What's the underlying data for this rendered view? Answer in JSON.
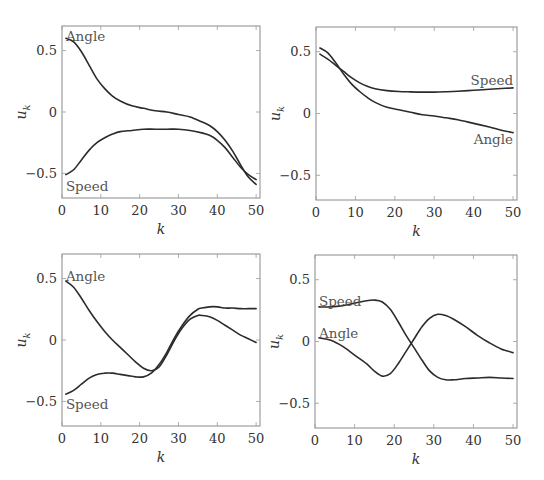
{
  "figure": {
    "panels_layout": "2x2"
  },
  "chart_data": [
    {
      "type": "line",
      "panel": "top-left",
      "title": "",
      "xlabel": "k",
      "ylabel": "u_k",
      "xlim": [
        0,
        51
      ],
      "ylim": [
        -0.7,
        0.7
      ],
      "xticks": [
        0,
        10,
        20,
        30,
        40,
        50
      ],
      "yticks": [
        -0.5,
        0,
        0.5
      ],
      "ytick_labels": [
        "−0.5",
        "0",
        "0.5"
      ],
      "grid": false,
      "legend": "inline labels",
      "series": [
        {
          "name": "Angle",
          "label_pos": {
            "k": 1,
            "u": 0.62,
            "anchor": "start"
          },
          "x": [
            1,
            3,
            5,
            7,
            9,
            11,
            13,
            15,
            18,
            21,
            24,
            27,
            30,
            33,
            36,
            38,
            40,
            42,
            44,
            46,
            48,
            50
          ],
          "values": [
            0.6,
            0.57,
            0.49,
            0.38,
            0.27,
            0.19,
            0.13,
            0.09,
            0.05,
            0.03,
            0.01,
            0.0,
            -0.02,
            -0.04,
            -0.08,
            -0.11,
            -0.16,
            -0.23,
            -0.32,
            -0.43,
            -0.53,
            -0.59
          ]
        },
        {
          "name": "Speed",
          "label_pos": {
            "k": 1,
            "u": -0.6,
            "anchor": "start"
          },
          "x": [
            1,
            3,
            5,
            7,
            9,
            11,
            13,
            15,
            18,
            21,
            24,
            27,
            30,
            33,
            36,
            38,
            40,
            42,
            44,
            46,
            48,
            50
          ],
          "values": [
            -0.51,
            -0.47,
            -0.39,
            -0.31,
            -0.25,
            -0.21,
            -0.18,
            -0.16,
            -0.15,
            -0.14,
            -0.14,
            -0.14,
            -0.14,
            -0.15,
            -0.17,
            -0.19,
            -0.23,
            -0.29,
            -0.37,
            -0.45,
            -0.51,
            -0.55
          ]
        }
      ]
    },
    {
      "type": "line",
      "panel": "top-right",
      "title": "",
      "xlabel": "k",
      "ylabel": "u_k",
      "xlim": [
        0,
        51
      ],
      "ylim": [
        -0.7,
        0.7
      ],
      "xticks": [
        0,
        10,
        20,
        30,
        40,
        50
      ],
      "yticks": [
        -0.5,
        0,
        0.5
      ],
      "ytick_labels": [
        "−0.5",
        "0",
        "0.5"
      ],
      "grid": false,
      "legend": "inline labels",
      "series": [
        {
          "name": "Speed",
          "label_pos": {
            "k": 50,
            "u": 0.27,
            "anchor": "end"
          },
          "x": [
            1,
            3,
            5,
            7,
            9,
            11,
            13,
            15,
            18,
            21,
            24,
            27,
            30,
            33,
            36,
            40,
            44,
            47,
            50
          ],
          "values": [
            0.48,
            0.44,
            0.39,
            0.34,
            0.29,
            0.25,
            0.22,
            0.2,
            0.185,
            0.178,
            0.175,
            0.173,
            0.173,
            0.176,
            0.18,
            0.188,
            0.196,
            0.202,
            0.207
          ]
        },
        {
          "name": "Angle",
          "label_pos": {
            "k": 50,
            "u": -0.21,
            "anchor": "end"
          },
          "x": [
            1,
            3,
            5,
            7,
            9,
            11,
            13,
            15,
            18,
            21,
            24,
            27,
            30,
            33,
            36,
            40,
            44,
            47,
            50
          ],
          "values": [
            0.53,
            0.49,
            0.41,
            0.32,
            0.24,
            0.18,
            0.13,
            0.09,
            0.05,
            0.03,
            0.01,
            -0.01,
            -0.02,
            -0.035,
            -0.05,
            -0.08,
            -0.11,
            -0.135,
            -0.155
          ]
        }
      ]
    },
    {
      "type": "line",
      "panel": "bottom-left",
      "title": "",
      "xlabel": "k",
      "ylabel": "u_k",
      "xlim": [
        0,
        51
      ],
      "ylim": [
        -0.7,
        0.7
      ],
      "xticks": [
        0,
        10,
        20,
        30,
        40,
        50
      ],
      "yticks": [
        -0.5,
        0,
        0.5
      ],
      "ytick_labels": [
        "−0.5",
        "0",
        "0.5"
      ],
      "grid": false,
      "legend": "inline labels",
      "series": [
        {
          "name": "Angle",
          "label_pos": {
            "k": 1,
            "u": 0.52,
            "anchor": "start"
          },
          "x": [
            1,
            3,
            5,
            7,
            9,
            11,
            13,
            15,
            17,
            19,
            21,
            23,
            25,
            27,
            29,
            31,
            33,
            35,
            36,
            38,
            40,
            42,
            44,
            46,
            48,
            50
          ],
          "values": [
            0.48,
            0.43,
            0.34,
            0.24,
            0.15,
            0.07,
            0.0,
            -0.06,
            -0.12,
            -0.18,
            -0.23,
            -0.25,
            -0.22,
            -0.12,
            0.0,
            0.1,
            0.17,
            0.2,
            0.2,
            0.19,
            0.16,
            0.12,
            0.08,
            0.04,
            0.01,
            -0.02
          ]
        },
        {
          "name": "Speed",
          "label_pos": {
            "k": 1,
            "u": -0.52,
            "anchor": "start"
          },
          "x": [
            1,
            3,
            5,
            7,
            9,
            11,
            13,
            15,
            17,
            19,
            21,
            23,
            25,
            27,
            29,
            31,
            33,
            35,
            36,
            38,
            40,
            42,
            44,
            46,
            48,
            50
          ],
          "values": [
            -0.44,
            -0.41,
            -0.36,
            -0.31,
            -0.28,
            -0.27,
            -0.27,
            -0.28,
            -0.29,
            -0.3,
            -0.3,
            -0.27,
            -0.2,
            -0.1,
            0.02,
            0.12,
            0.2,
            0.25,
            0.26,
            0.27,
            0.27,
            0.26,
            0.26,
            0.255,
            0.255,
            0.255
          ]
        }
      ]
    },
    {
      "type": "line",
      "panel": "bottom-right",
      "title": "",
      "xlabel": "k",
      "ylabel": "u_k",
      "xlim": [
        0,
        51
      ],
      "ylim": [
        -0.7,
        0.7
      ],
      "xticks": [
        0,
        10,
        20,
        30,
        40,
        50
      ],
      "yticks": [
        -0.5,
        0,
        0.5
      ],
      "ytick_labels": [
        "−0.5",
        "0",
        "0.5"
      ],
      "grid": false,
      "legend": "inline labels",
      "series": [
        {
          "name": "Speed",
          "label_pos": {
            "k": 1,
            "u": 0.33,
            "anchor": "start"
          },
          "x": [
            1,
            4,
            7,
            10,
            13,
            15,
            17,
            19,
            21,
            23,
            25,
            27,
            29,
            31,
            33,
            35,
            38,
            41,
            44,
            47,
            50
          ],
          "values": [
            0.28,
            0.28,
            0.29,
            0.31,
            0.33,
            0.335,
            0.32,
            0.26,
            0.16,
            0.05,
            -0.05,
            -0.15,
            -0.24,
            -0.29,
            -0.31,
            -0.31,
            -0.3,
            -0.295,
            -0.29,
            -0.295,
            -0.3
          ]
        },
        {
          "name": "Angle",
          "label_pos": {
            "k": 1,
            "u": 0.07,
            "anchor": "start"
          },
          "x": [
            1,
            4,
            7,
            10,
            13,
            15,
            17,
            19,
            21,
            23,
            25,
            27,
            29,
            31,
            33,
            35,
            38,
            41,
            44,
            47,
            50
          ],
          "values": [
            0.03,
            0.01,
            -0.04,
            -0.11,
            -0.18,
            -0.24,
            -0.28,
            -0.26,
            -0.18,
            -0.08,
            0.02,
            0.12,
            0.19,
            0.22,
            0.21,
            0.18,
            0.12,
            0.05,
            -0.01,
            -0.06,
            -0.09
          ]
        }
      ]
    }
  ]
}
